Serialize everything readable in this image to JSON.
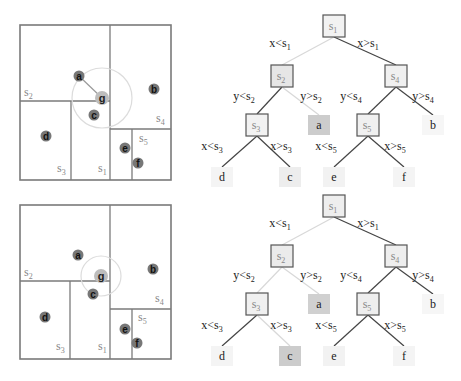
{
  "panels": [
    {
      "name": "top",
      "space": {
        "box": [
          20,
          25,
          171,
          180
        ],
        "splits": [
          {
            "id": "s1",
            "label": "s",
            "sub": "1",
            "type": "v",
            "x": 110,
            "y1": 25,
            "y2": 180,
            "lx": 98,
            "ly": 172
          },
          {
            "id": "s2",
            "label": "s",
            "sub": "2",
            "type": "h",
            "y": 101,
            "x1": 20,
            "x2": 110,
            "lx": 24,
            "ly": 96
          },
          {
            "id": "s3",
            "label": "s",
            "sub": "3",
            "type": "v",
            "x": 71,
            "y1": 101,
            "y2": 180,
            "lx": 57,
            "ly": 172
          },
          {
            "id": "s4",
            "label": "s",
            "sub": "4",
            "type": "h",
            "y": 129,
            "x1": 110,
            "x2": 171,
            "lx": 156,
            "ly": 122
          },
          {
            "id": "s5",
            "label": "s",
            "sub": "5",
            "type": "v",
            "x": 132,
            "y1": 129,
            "y2": 180,
            "lx": 139,
            "ly": 142
          }
        ],
        "query": {
          "label": "g",
          "x": 102,
          "y": 98,
          "radius": 30,
          "nearest": "a"
        },
        "points": [
          {
            "label": "a",
            "x": 79,
            "y": 76
          },
          {
            "label": "b",
            "x": 154,
            "y": 89
          },
          {
            "label": "c",
            "x": 94,
            "y": 115
          },
          {
            "label": "d",
            "x": 46,
            "y": 136
          },
          {
            "label": "e",
            "x": 125,
            "y": 148
          },
          {
            "label": "f",
            "x": 138,
            "y": 163
          }
        ]
      },
      "tree": {
        "nodes": [
          {
            "id": "s1",
            "text": "s",
            "sub": "1",
            "x": 334,
            "y": 26,
            "kind": "split",
            "shade": "#f2f2f2"
          },
          {
            "id": "s2",
            "text": "s",
            "sub": "2",
            "x": 282,
            "y": 76,
            "kind": "split",
            "shade": "#e6e6e6"
          },
          {
            "id": "s4",
            "text": "s",
            "sub": "4",
            "x": 396,
            "y": 76,
            "kind": "split",
            "shade": "#f0f0f0"
          },
          {
            "id": "s3",
            "text": "s",
            "sub": "3",
            "x": 257,
            "y": 125,
            "kind": "split",
            "shade": "#f2f2f2"
          },
          {
            "id": "a",
            "text": "a",
            "sub": "",
            "x": 319,
            "y": 125,
            "kind": "leaf",
            "shade": "#cccccc"
          },
          {
            "id": "s5",
            "text": "s",
            "sub": "5",
            "x": 368,
            "y": 125,
            "kind": "split",
            "shade": "#f0f0f0"
          },
          {
            "id": "b",
            "text": "b",
            "sub": "",
            "x": 433,
            "y": 125,
            "kind": "leaf",
            "shade": "#f6f6f6"
          },
          {
            "id": "d",
            "text": "d",
            "sub": "",
            "x": 222,
            "y": 177,
            "kind": "leaf",
            "shade": "#f4f4f4"
          },
          {
            "id": "c",
            "text": "c",
            "sub": "",
            "x": 290,
            "y": 177,
            "kind": "leaf",
            "shade": "#ededed"
          },
          {
            "id": "e",
            "text": "e",
            "sub": "",
            "x": 334,
            "y": 177,
            "kind": "leaf",
            "shade": "#f2f2f2"
          },
          {
            "id": "f",
            "text": "f",
            "sub": "",
            "x": 404,
            "y": 177,
            "kind": "leaf",
            "shade": "#f4f4f4"
          }
        ],
        "edges": [
          {
            "from": "s1",
            "to": "s2",
            "label": "x<s",
            "sub": "1",
            "lx": 280,
            "ly": 47,
            "faded": true
          },
          {
            "from": "s1",
            "to": "s4",
            "label": "x>s",
            "sub": "1",
            "lx": 368,
            "ly": 47,
            "faded": false
          },
          {
            "from": "s2",
            "to": "s3",
            "label": "y<s",
            "sub": "2",
            "lx": 244,
            "ly": 100,
            "faded": false
          },
          {
            "from": "s2",
            "to": "a",
            "label": "y>s",
            "sub": "2",
            "lx": 311,
            "ly": 100,
            "faded": true
          },
          {
            "from": "s4",
            "to": "s5",
            "label": "y<s",
            "sub": "4",
            "lx": 351,
            "ly": 100,
            "faded": false
          },
          {
            "from": "s4",
            "to": "b",
            "label": "y>s",
            "sub": "4",
            "lx": 423,
            "ly": 100,
            "faded": false
          },
          {
            "from": "s3",
            "to": "d",
            "label": "x<s",
            "sub": "3",
            "lx": 212,
            "ly": 150,
            "faded": false
          },
          {
            "from": "s3",
            "to": "c",
            "label": "x>s",
            "sub": "3",
            "lx": 281,
            "ly": 150,
            "faded": false
          },
          {
            "from": "s5",
            "to": "e",
            "label": "x<s",
            "sub": "5",
            "lx": 326,
            "ly": 150,
            "faded": false
          },
          {
            "from": "s5",
            "to": "f",
            "label": "x>s",
            "sub": "5",
            "lx": 395,
            "ly": 150,
            "faded": false
          }
        ]
      }
    },
    {
      "name": "bottom",
      "space": {
        "box": [
          20,
          205,
          171,
          359
        ],
        "splits": [
          {
            "id": "s1",
            "label": "s",
            "sub": "1",
            "type": "v",
            "x": 110,
            "y1": 205,
            "y2": 359,
            "lx": 98,
            "ly": 350
          },
          {
            "id": "s2",
            "label": "s",
            "sub": "2",
            "type": "h",
            "y": 281,
            "x1": 20,
            "x2": 110,
            "lx": 24,
            "ly": 276
          },
          {
            "id": "s3",
            "label": "s",
            "sub": "3",
            "type": "v",
            "x": 70,
            "y1": 281,
            "y2": 359,
            "lx": 56,
            "ly": 350
          },
          {
            "id": "s4",
            "label": "s",
            "sub": "4",
            "type": "h",
            "y": 309,
            "x1": 110,
            "x2": 171,
            "lx": 155,
            "ly": 302
          },
          {
            "id": "s5",
            "label": "s",
            "sub": "5",
            "type": "v",
            "x": 132,
            "y1": 309,
            "y2": 359,
            "lx": 138,
            "ly": 321
          }
        ],
        "query": {
          "label": "g",
          "x": 101,
          "y": 276,
          "radius": 20,
          "nearest": ""
        },
        "points": [
          {
            "label": "a",
            "x": 78,
            "y": 255
          },
          {
            "label": "b",
            "x": 153,
            "y": 269
          },
          {
            "label": "c",
            "x": 93,
            "y": 294
          },
          {
            "label": "d",
            "x": 45,
            "y": 317
          },
          {
            "label": "e",
            "x": 125,
            "y": 329
          },
          {
            "label": "f",
            "x": 137,
            "y": 343
          }
        ]
      },
      "tree": {
        "nodes": [
          {
            "id": "s1",
            "text": "s",
            "sub": "1",
            "x": 334,
            "y": 206,
            "kind": "split",
            "shade": "#eeeeee"
          },
          {
            "id": "s2",
            "text": "s",
            "sub": "2",
            "x": 282,
            "y": 256,
            "kind": "split",
            "shade": "#ebebeb"
          },
          {
            "id": "s4",
            "text": "s",
            "sub": "4",
            "x": 396,
            "y": 256,
            "kind": "split",
            "shade": "#eeeeee"
          },
          {
            "id": "s3",
            "text": "s",
            "sub": "3",
            "x": 257,
            "y": 304,
            "kind": "split",
            "shade": "#f0f0f0"
          },
          {
            "id": "a",
            "text": "a",
            "sub": "",
            "x": 319,
            "y": 304,
            "kind": "leaf",
            "shade": "#d0d0d0"
          },
          {
            "id": "s5",
            "text": "s",
            "sub": "5",
            "x": 368,
            "y": 304,
            "kind": "split",
            "shade": "#eeeeee"
          },
          {
            "id": "b",
            "text": "b",
            "sub": "",
            "x": 433,
            "y": 304,
            "kind": "leaf",
            "shade": "#f6f6f6"
          },
          {
            "id": "d",
            "text": "d",
            "sub": "",
            "x": 222,
            "y": 356,
            "kind": "leaf",
            "shade": "#f4f4f4"
          },
          {
            "id": "c",
            "text": "c",
            "sub": "",
            "x": 290,
            "y": 356,
            "kind": "leaf",
            "shade": "#cccccc"
          },
          {
            "id": "e",
            "text": "e",
            "sub": "",
            "x": 334,
            "y": 356,
            "kind": "leaf",
            "shade": "#f2f2f2"
          },
          {
            "id": "f",
            "text": "f",
            "sub": "",
            "x": 404,
            "y": 356,
            "kind": "leaf",
            "shade": "#f4f4f4"
          }
        ],
        "edges": [
          {
            "from": "s1",
            "to": "s2",
            "label": "x<s",
            "sub": "1",
            "lx": 280,
            "ly": 227,
            "faded": true
          },
          {
            "from": "s1",
            "to": "s4",
            "label": "x>s",
            "sub": "1",
            "lx": 368,
            "ly": 227,
            "faded": false
          },
          {
            "from": "s2",
            "to": "s3",
            "label": "y<s",
            "sub": "2",
            "lx": 244,
            "ly": 279,
            "faded": true
          },
          {
            "from": "s2",
            "to": "a",
            "label": "y>s",
            "sub": "2",
            "lx": 311,
            "ly": 279,
            "faded": true
          },
          {
            "from": "s4",
            "to": "s5",
            "label": "y<s",
            "sub": "4",
            "lx": 351,
            "ly": 279,
            "faded": false
          },
          {
            "from": "s4",
            "to": "b",
            "label": "y>s",
            "sub": "4",
            "lx": 423,
            "ly": 279,
            "faded": false
          },
          {
            "from": "s3",
            "to": "d",
            "label": "x<s",
            "sub": "3",
            "lx": 212,
            "ly": 329,
            "faded": false
          },
          {
            "from": "s3",
            "to": "c",
            "label": "x>s",
            "sub": "3",
            "lx": 281,
            "ly": 329,
            "faded": true
          },
          {
            "from": "s5",
            "to": "e",
            "label": "x<s",
            "sub": "5",
            "lx": 326,
            "ly": 329,
            "faded": false
          },
          {
            "from": "s5",
            "to": "f",
            "label": "x>s",
            "sub": "5",
            "lx": 395,
            "ly": 329,
            "faded": false
          }
        ]
      }
    }
  ],
  "colors": {
    "line": "#7a7a7a",
    "faded_line": "#d8d8d8",
    "circle": "#dcdcdc",
    "point": "#777777",
    "query_point": "#bdbdbd",
    "label": "#888888",
    "text": "#222222"
  }
}
